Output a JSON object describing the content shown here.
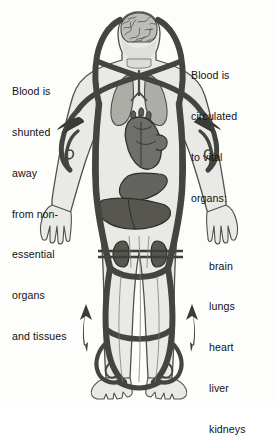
{
  "diagram": {
    "background_color": "#fdfdfc",
    "ink_color": "#111111"
  },
  "captions": {
    "left": {
      "name": "shunted-away-caption",
      "lines": [
        "Blood is",
        "shunted",
        "away",
        "from non-",
        "essential",
        "organs",
        "and tissues"
      ]
    },
    "right": {
      "name": "vital-organs-caption",
      "lines": [
        "Blood is",
        "circulated",
        "to vital",
        "organs:"
      ],
      "organ_list": [
        "brain",
        "lungs",
        "heart",
        "liver",
        "kidneys"
      ]
    }
  },
  "figure": {
    "label": "human-body-outline",
    "body_fill": "#e9e9e6",
    "body_outline": "#5d5d5a",
    "vessel_color": "#4a4a48",
    "vessel_dark": "#3b3b39",
    "organs": [
      {
        "name": "brain",
        "fill": "#b9b9b4",
        "detail": "#5d5d5a"
      },
      {
        "name": "lungs",
        "fill": "#a9a9a4",
        "detail": "#5d5d5a"
      },
      {
        "name": "heart",
        "fill": "#6a6a67",
        "detail": "#33332f"
      },
      {
        "name": "liver",
        "fill": "#5a5a57",
        "detail": "#33332f"
      },
      {
        "name": "stomach",
        "fill": "#6a6a67",
        "detail": "#33332f"
      },
      {
        "name": "kidney-left",
        "fill": "#5a5a57",
        "detail": "#33332f"
      },
      {
        "name": "kidney-right",
        "fill": "#5a5a57",
        "detail": "#33332f"
      }
    ],
    "arrows": [
      {
        "name": "shunt-arrow-upper-left",
        "direction": "up-left"
      },
      {
        "name": "shunt-arrow-upper-right",
        "direction": "up-right"
      },
      {
        "name": "shunt-arrow-lower-left",
        "direction": "up"
      },
      {
        "name": "shunt-arrow-lower-right",
        "direction": "up"
      }
    ]
  }
}
